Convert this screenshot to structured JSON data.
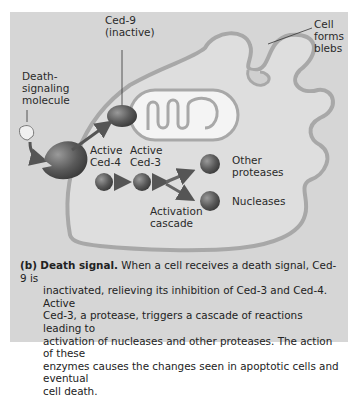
{
  "figure": {
    "labels": {
      "ced9": [
        "Ced-9",
        "(inactive)"
      ],
      "death_molecule": [
        "Death-",
        "signaling",
        "molecule"
      ],
      "cell_blebs": [
        "Cell",
        "forms",
        "blebs"
      ],
      "active_ced4": [
        "Active",
        "Ced-4"
      ],
      "active_ced3": [
        "Active",
        "Ced-3"
      ],
      "other_proteases": [
        "Other",
        "proteases"
      ],
      "nucleases": "Nucleases",
      "activation_cascade": [
        "Activation",
        "cascade"
      ]
    },
    "colors": {
      "panel_bg": "#d6d6d6",
      "cell_fill": "#dedede",
      "membrane": "#a8a8a8",
      "protein": "#5a5a5a",
      "mitochondrion": "#f4f4f4"
    }
  },
  "caption": {
    "tag": "(b)",
    "title": "Death signal.",
    "line1": "When a cell receives a death signal, Ced-9 is",
    "lines": [
      "inactivated, relieving its inhibition of Ced-3 and Ced-4. Active",
      "Ced-3, a protease, triggers a cascade of reactions leading to",
      "activation of nucleases and other proteases. The action of these",
      "enzymes causes the changes seen in apoptotic cells and eventual",
      "cell death."
    ]
  }
}
